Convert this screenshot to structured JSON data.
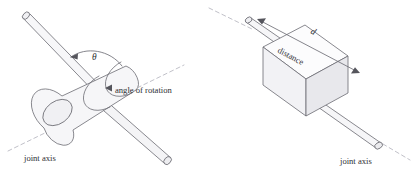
{
  "figure": {
    "background_color": "#ffffff",
    "line_color": "#6b6b72",
    "dash_color": "#b9b9c2",
    "fill_light": "#fbfbfc",
    "fill_mid": "#f2f2f4",
    "fill_dark": "#e7e7ea"
  },
  "left_figure": {
    "name": "revolute-joint",
    "angle_symbol": "θ",
    "angle_label": "angle of rotation",
    "axis_label": "joint axis"
  },
  "right_figure": {
    "name": "prismatic-joint",
    "distance_symbol": "d",
    "distance_label": "distance",
    "axis_label": "joint axis"
  }
}
